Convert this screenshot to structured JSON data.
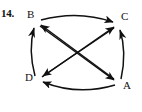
{
  "figure": {
    "item_number": "14.",
    "type": "directed-graph",
    "stroke_color": "#111111",
    "background_color": "#ffffff",
    "vertices": [
      {
        "id": "B",
        "label": "B",
        "x": 36,
        "y": 22
      },
      {
        "id": "C",
        "label": "C",
        "x": 118,
        "y": 24
      },
      {
        "id": "D",
        "label": "D",
        "x": 38,
        "y": 80
      },
      {
        "id": "A",
        "label": "A",
        "x": 120,
        "y": 84
      }
    ],
    "edges": [
      {
        "from": "B",
        "to": "C",
        "style": "curved",
        "name": "edge-b-to-c"
      },
      {
        "from": "D",
        "to": "B",
        "style": "curved",
        "name": "edge-d-to-b"
      },
      {
        "from": "A",
        "to": "C",
        "style": "curved",
        "name": "edge-a-to-c"
      },
      {
        "from": "A",
        "to": "D",
        "style": "curved",
        "name": "edge-a-to-d"
      },
      {
        "from": "B",
        "to": "A",
        "style": "straight",
        "name": "edge-b-to-a"
      },
      {
        "from": "A",
        "to": "B",
        "style": "straight",
        "name": "edge-a-to-b"
      },
      {
        "from": "D",
        "to": "C",
        "style": "straight",
        "name": "edge-d-to-c"
      },
      {
        "from": "C",
        "to": "D",
        "style": "straight",
        "name": "edge-c-to-d"
      }
    ]
  }
}
